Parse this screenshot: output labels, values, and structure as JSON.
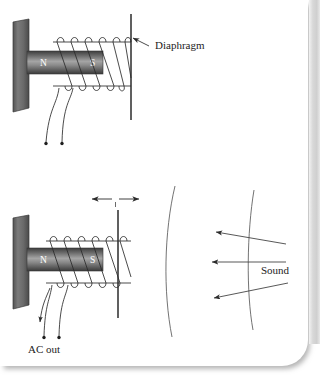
{
  "figure": {
    "title_text": "",
    "background_color": "#ffffff",
    "ink_color": "#2b2b2b",
    "magnet_dark": "#4a4a4a",
    "magnet_light": "#9c9c9c",
    "wall_color": "#5f5f5f",
    "page_edge_color": "#d8d8d8"
  },
  "panels": [
    {
      "id": "top-panel",
      "name": "diaphragm-panel",
      "labels": {
        "diaphragm": "Diaphragm",
        "north_pole": "N",
        "south_pole": "S"
      }
    },
    {
      "id": "bottom-panel",
      "name": "sound-to-ac-panel",
      "labels": {
        "ac_out": "AC out",
        "sound": "Sound",
        "north_pole": "N",
        "south_pole": "S"
      }
    }
  ],
  "annotations": {
    "diaphragm_label": "Diaphragm",
    "ac_out_label": "AC out",
    "sound_label": "Sound",
    "north": "N",
    "south": "S",
    "vibration_arrow": "double-headed-horizontal",
    "sound_arrow_count": 3,
    "wavefront_count": 2,
    "coil_turns": 6,
    "lead_terminals": 2
  }
}
